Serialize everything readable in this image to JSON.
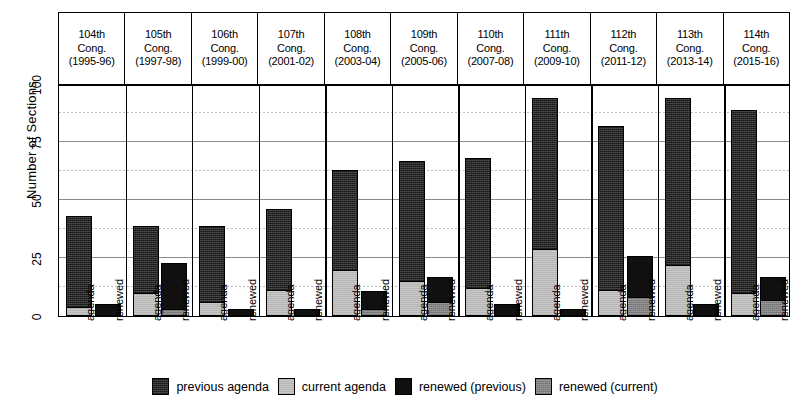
{
  "chart_data": {
    "type": "bar",
    "title": "",
    "xlabel": "",
    "ylabel": "Number of Sections",
    "ylim": [
      0,
      100
    ],
    "yticks": [
      0,
      25,
      50,
      75,
      100
    ],
    "grid": true,
    "minor_gridlines": [
      12.5,
      37.5,
      62.5,
      87.5
    ],
    "stacked": true,
    "legend_position": "bottom",
    "panels": [
      "104th Cong. (1995-96)",
      "105th Cong. (1997-98)",
      "106th Cong. (1999-00)",
      "107th Cong. (2001-02)",
      "108th Cong. (2003-04)",
      "109th Cong. (2005-06)",
      "110th Cong. (2007-08)",
      "111th Cong. (2009-10)",
      "112th Cong. (2011-12)",
      "113th Cong. (2013-14)",
      "114th Cong. (2015-16)"
    ],
    "categories": [
      "agenda",
      "renewed"
    ],
    "series": [
      {
        "name": "previous agenda",
        "key": "prev",
        "color": "#3a3a3a"
      },
      {
        "name": "current agenda",
        "key": "cur",
        "color": "#c9c9c9"
      },
      {
        "name": "renewed (previous)",
        "key": "renprev",
        "color": "#101010"
      },
      {
        "name": "renewed (current)",
        "key": "rencur",
        "color": "#8f8f8f"
      }
    ],
    "bars": [
      {
        "panel": "104th Cong. (1995-96)",
        "agenda": {
          "current agenda": 4,
          "previous agenda": 39,
          "total": 43
        },
        "renewed": {
          "renewed (current)": 0,
          "renewed (previous)": 5,
          "total": 5
        }
      },
      {
        "panel": "105th Cong. (1997-98)",
        "agenda": {
          "current agenda": 10,
          "previous agenda": 29,
          "total": 39
        },
        "renewed": {
          "renewed (current)": 3,
          "renewed (previous)": 20,
          "total": 23
        }
      },
      {
        "panel": "106th Cong. (1999-00)",
        "agenda": {
          "current agenda": 6,
          "previous agenda": 33,
          "total": 39
        },
        "renewed": {
          "renewed (current)": 0,
          "renewed (previous)": 3,
          "total": 3
        }
      },
      {
        "panel": "107th Cong. (2001-02)",
        "agenda": {
          "current agenda": 11,
          "previous agenda": 35,
          "total": 46
        },
        "renewed": {
          "renewed (current)": 0,
          "renewed (previous)": 3,
          "total": 3
        }
      },
      {
        "panel": "108th Cong. (2003-04)",
        "agenda": {
          "current agenda": 20,
          "previous agenda": 43,
          "total": 63
        },
        "renewed": {
          "renewed (current)": 3,
          "renewed (previous)": 8,
          "total": 11
        }
      },
      {
        "panel": "109th Cong. (2005-06)",
        "agenda": {
          "current agenda": 15,
          "previous agenda": 52,
          "total": 67
        },
        "renewed": {
          "renewed (current)": 6,
          "renewed (previous)": 11,
          "total": 17
        }
      },
      {
        "panel": "110th Cong. (2007-08)",
        "agenda": {
          "current agenda": 12,
          "previous agenda": 56,
          "total": 68
        },
        "renewed": {
          "renewed (current)": 0,
          "renewed (previous)": 5,
          "total": 5
        }
      },
      {
        "panel": "111th Cong. (2009-10)",
        "agenda": {
          "current agenda": 29,
          "previous agenda": 65,
          "total": 94
        },
        "renewed": {
          "renewed (current)": 0,
          "renewed (previous)": 3,
          "total": 3
        }
      },
      {
        "panel": "112th Cong. (2011-12)",
        "agenda": {
          "current agenda": 11,
          "previous agenda": 71,
          "total": 82
        },
        "renewed": {
          "renewed (current)": 8,
          "renewed (previous)": 18,
          "total": 26
        }
      },
      {
        "panel": "113th Cong. (2013-14)",
        "agenda": {
          "current agenda": 22,
          "previous agenda": 72,
          "total": 94
        },
        "renewed": {
          "renewed (current)": 0,
          "renewed (previous)": 5,
          "total": 5
        }
      },
      {
        "panel": "114th Cong. (2015-16)",
        "agenda": {
          "current agenda": 10,
          "previous agenda": 79,
          "total": 89
        },
        "renewed": {
          "renewed (current)": 7,
          "renewed (previous)": 10,
          "total": 17
        }
      }
    ]
  },
  "axis": {
    "y_title": "Number of Sections",
    "y_ticks": [
      "0",
      "25",
      "50",
      "75",
      "100"
    ],
    "x_tick_agenda": "agenda",
    "x_tick_renewed": "renewed"
  },
  "header": {
    "cells": [
      {
        "line1": "104th",
        "line2": "Cong.",
        "line3": "(1995-96)"
      },
      {
        "line1": "105th",
        "line2": "Cong.",
        "line3": "(1997-98)"
      },
      {
        "line1": "106th",
        "line2": "Cong.",
        "line3": "(1999-00)"
      },
      {
        "line1": "107th",
        "line2": "Cong.",
        "line3": "(2001-02)"
      },
      {
        "line1": "108th",
        "line2": "Cong.",
        "line3": "(2003-04)"
      },
      {
        "line1": "109th",
        "line2": "Cong.",
        "line3": "(2005-06)"
      },
      {
        "line1": "110th",
        "line2": "Cong.",
        "line3": "(2007-08)"
      },
      {
        "line1": "111th",
        "line2": "Cong.",
        "line3": "(2009-10)"
      },
      {
        "line1": "112th",
        "line2": "Cong.",
        "line3": "(2011-12)"
      },
      {
        "line1": "113th",
        "line2": "Cong.",
        "line3": "(2013-14)"
      },
      {
        "line1": "114th",
        "line2": "Cong.",
        "line3": "(2015-16)"
      }
    ]
  },
  "legend": {
    "items": [
      {
        "label": "previous agenda",
        "fill": "fill-prev"
      },
      {
        "label": "current agenda",
        "fill": "fill-cur"
      },
      {
        "label": "renewed (previous)",
        "fill": "fill-renprev"
      },
      {
        "label": "renewed (current)",
        "fill": "fill-rencur"
      }
    ]
  }
}
